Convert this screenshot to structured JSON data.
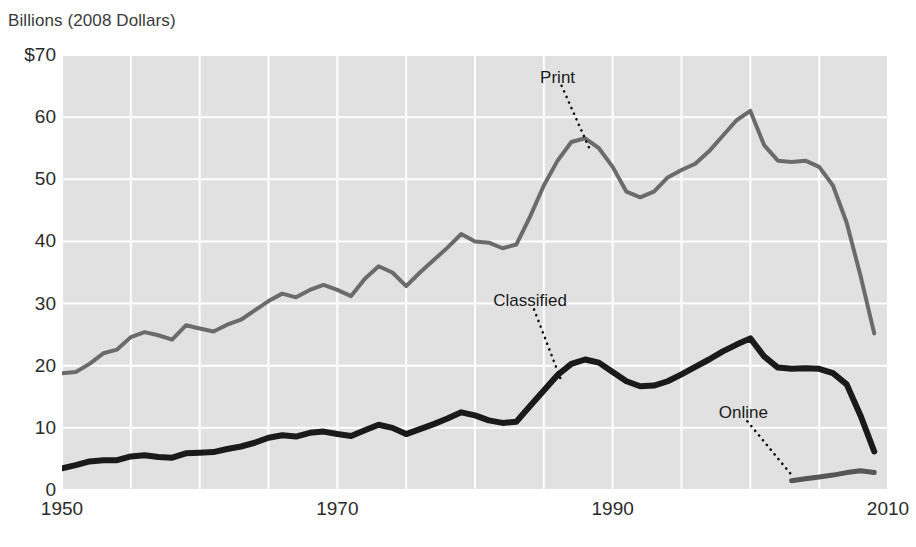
{
  "chart_data": {
    "type": "line",
    "title": "Billions (2008 Dollars)",
    "xlabel": "",
    "ylabel": "Billions (2008 Dollars)",
    "xlim": [
      1950,
      2010
    ],
    "ylim": [
      0,
      70
    ],
    "grid": true,
    "x_ticks": [
      "1950",
      "1970",
      "1990",
      "2010"
    ],
    "x_tick_values": [
      1950,
      1970,
      1990,
      2010
    ],
    "y_ticks": [
      "0",
      "10",
      "20",
      "30",
      "40",
      "50",
      "60",
      "$70"
    ],
    "y_tick_values": [
      0,
      10,
      20,
      30,
      40,
      50,
      60,
      70
    ],
    "x_gridline_step": 5,
    "y_gridline_step": 10,
    "legend_position": "inline-annotations",
    "plot_background": "#e1e1e1",
    "gridline_color": "#ffffff",
    "series": [
      {
        "name": "Print",
        "color": "#6b6b6b",
        "width": 4,
        "label_x": 1986,
        "label_y": 66.5,
        "leader_to_x": 1988.3,
        "leader_to_y": 55.0,
        "x": [
          1950,
          1951,
          1952,
          1953,
          1954,
          1955,
          1956,
          1957,
          1958,
          1959,
          1960,
          1961,
          1962,
          1963,
          1964,
          1965,
          1966,
          1967,
          1968,
          1969,
          1970,
          1971,
          1972,
          1973,
          1974,
          1975,
          1976,
          1977,
          1978,
          1979,
          1980,
          1981,
          1982,
          1983,
          1984,
          1985,
          1986,
          1987,
          1988,
          1989,
          1990,
          1991,
          1992,
          1993,
          1994,
          1995,
          1996,
          1997,
          1998,
          1999,
          2000,
          2001,
          2002,
          2003,
          2004,
          2005,
          2006,
          2007,
          2008,
          2009
        ],
        "values": [
          18.8,
          19.0,
          20.3,
          22.0,
          22.6,
          24.6,
          25.4,
          24.9,
          24.2,
          26.5,
          26.0,
          25.5,
          26.6,
          27.4,
          28.9,
          30.4,
          31.6,
          31.0,
          32.2,
          33.0,
          32.2,
          31.2,
          34.0,
          36.0,
          35.0,
          32.8,
          35.0,
          37.0,
          39.0,
          41.2,
          40.0,
          39.8,
          38.9,
          39.5,
          44.0,
          49.0,
          53.0,
          56.0,
          56.6,
          55.0,
          52.0,
          48.0,
          47.1,
          48.0,
          50.3,
          51.5,
          52.5,
          54.5,
          57.0,
          59.5,
          61.0,
          55.5,
          53.0,
          52.8,
          53.0,
          52.0,
          49.0,
          43.0,
          34.5,
          25.2
        ]
      },
      {
        "name": "Classified",
        "color": "#1a1a1a",
        "width": 6,
        "label_x": 1984,
        "label_y": 30.5,
        "leader_to_x": 1986.2,
        "leader_to_y": 18.0,
        "x": [
          1950,
          1951,
          1952,
          1953,
          1954,
          1955,
          1956,
          1957,
          1958,
          1959,
          1960,
          1961,
          1962,
          1963,
          1964,
          1965,
          1966,
          1967,
          1968,
          1969,
          1970,
          1971,
          1972,
          1973,
          1974,
          1975,
          1976,
          1977,
          1978,
          1979,
          1980,
          1981,
          1982,
          1983,
          1984,
          1985,
          1986,
          1987,
          1988,
          1989,
          1990,
          1991,
          1992,
          1993,
          1994,
          1995,
          1996,
          1997,
          1998,
          1999,
          2000,
          2001,
          2002,
          2003,
          2004,
          2005,
          2006,
          2007,
          2008,
          2009
        ],
        "values": [
          3.5,
          4.0,
          4.6,
          4.8,
          4.8,
          5.4,
          5.6,
          5.3,
          5.2,
          5.9,
          6.0,
          6.1,
          6.6,
          7.0,
          7.6,
          8.4,
          8.8,
          8.6,
          9.2,
          9.4,
          9.0,
          8.7,
          9.6,
          10.5,
          10.0,
          9.0,
          9.8,
          10.6,
          11.5,
          12.5,
          12.0,
          11.2,
          10.8,
          11.0,
          13.5,
          16.0,
          18.5,
          20.3,
          21.0,
          20.5,
          19.0,
          17.5,
          16.7,
          16.8,
          17.5,
          18.6,
          19.8,
          21.0,
          22.3,
          23.4,
          24.4,
          21.5,
          19.7,
          19.5,
          19.6,
          19.5,
          18.8,
          17.0,
          12.0,
          6.2
        ]
      },
      {
        "name": "Online",
        "color": "#565656",
        "width": 5,
        "label_x": 1999.5,
        "label_y": 12.5,
        "leader_to_x": 2003.0,
        "leader_to_y": 2.4,
        "x": [
          2003,
          2004,
          2005,
          2006,
          2007,
          2008,
          2009
        ],
        "values": [
          1.5,
          1.8,
          2.1,
          2.4,
          2.8,
          3.1,
          2.8
        ]
      }
    ]
  }
}
